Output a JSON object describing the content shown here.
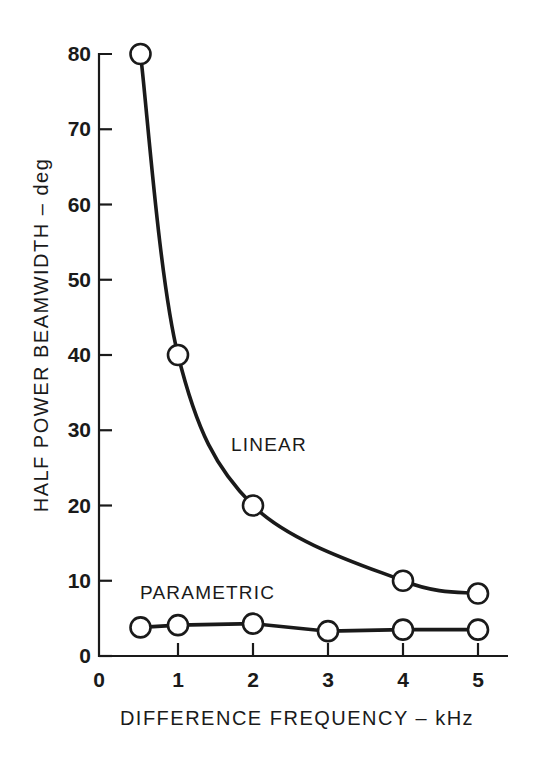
{
  "chart_data": {
    "type": "line",
    "title": "",
    "xlabel": "DIFFERENCE FREQUENCY – kHz",
    "ylabel": "HALF POWER BEAMWIDTH – deg",
    "xlim": [
      0,
      5.4
    ],
    "ylim": [
      0,
      80
    ],
    "grid": false,
    "legend": "inline labels",
    "x_ticks": [
      0,
      1,
      2,
      3,
      4,
      5
    ],
    "x_tick_labels": [
      "0",
      "1",
      "2",
      "3",
      "4",
      "5"
    ],
    "y_ticks": [
      0,
      10,
      20,
      30,
      40,
      50,
      60,
      70,
      80
    ],
    "y_tick_labels": [
      "0",
      "10",
      "20",
      "30",
      "40",
      "50",
      "60",
      "70",
      "80"
    ],
    "series": [
      {
        "name": "LINEAR",
        "label_text": "LINEAR",
        "marker": "open-circle",
        "x": [
          0.5,
          1,
          2,
          4,
          5
        ],
        "values": [
          80,
          40,
          20,
          10,
          8.3
        ]
      },
      {
        "name": "PARAMETRIC",
        "label_text": "PARAMETRIC",
        "marker": "open-circle",
        "x": [
          0.5,
          1,
          2,
          3,
          4,
          5
        ],
        "values": [
          3.8,
          4.1,
          4.3,
          3.3,
          3.5,
          3.5
        ]
      }
    ],
    "annotations": [
      {
        "text": "LINEAR",
        "x": 2.6,
        "y": 28
      },
      {
        "text": "PARAMETRIC",
        "x": 1.5,
        "y": 8
      }
    ]
  },
  "colors": {
    "ink": "#1a1a1a",
    "background": "#ffffff"
  }
}
